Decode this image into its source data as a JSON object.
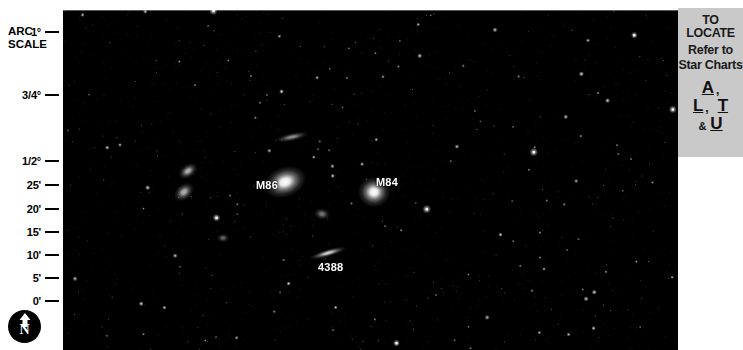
{
  "arc_scale": {
    "title_line1": "ARC",
    "title_line2": "SCALE",
    "ticks": [
      {
        "label": "1°",
        "y": 32
      },
      {
        "label": "3/4°",
        "y": 95
      },
      {
        "label": "1/2°",
        "y": 161
      },
      {
        "label": "25'",
        "y": 185
      },
      {
        "label": "20'",
        "y": 209
      },
      {
        "label": "15'",
        "y": 232
      },
      {
        "label": "10'",
        "y": 255
      },
      {
        "label": "5'",
        "y": 278
      },
      {
        "label": "0'",
        "y": 301
      }
    ],
    "compass_label": "N",
    "compass_direction": "north-up"
  },
  "sky_photo": {
    "background_color": "#000000",
    "labels": [
      {
        "text": "M86",
        "x": 193,
        "y": 170
      },
      {
        "text": "M84",
        "x": 313,
        "y": 167
      },
      {
        "text": "4388",
        "x": 255,
        "y": 252
      }
    ],
    "galaxies": [
      {
        "name": "M86",
        "x": 222,
        "y": 172,
        "rx": 11.5,
        "ry": 8.0,
        "angle": -20,
        "brightness": 1.0
      },
      {
        "name": "M84",
        "x": 311,
        "y": 182,
        "rx": 8.5,
        "ry": 8.0,
        "angle": 0,
        "brightness": 1.0
      },
      {
        "name": "NGC4388",
        "x": 265,
        "y": 243,
        "rx": 10.0,
        "ry": 2.0,
        "angle": -16,
        "brightness": 0.82
      },
      {
        "name": "NGC4402",
        "x": 229,
        "y": 127,
        "rx": 9.0,
        "ry": 2.2,
        "angle": -12,
        "brightness": 0.55
      },
      {
        "name": "NGC4387",
        "x": 125,
        "y": 161,
        "rx": 5.5,
        "ry": 3.5,
        "angle": -35,
        "brightness": 0.7
      },
      {
        "name": "NGC4413",
        "x": 121,
        "y": 182,
        "rx": 6.0,
        "ry": 4.2,
        "angle": -40,
        "brightness": 0.68
      },
      {
        "name": "anon-1",
        "x": 259,
        "y": 204,
        "rx": 4.5,
        "ry": 3.2,
        "angle": 10,
        "brightness": 0.45
      },
      {
        "name": "anon-2",
        "x": 160,
        "y": 228,
        "rx": 3.4,
        "ry": 2.4,
        "angle": 0,
        "brightness": 0.4
      }
    ],
    "star_count": 420
  },
  "locate_panel": {
    "title": "TO LOCATE",
    "subtitle_line1": "Refer to",
    "subtitle_line2": "Star Charts",
    "charts": [
      "A",
      "L",
      "T",
      "U"
    ],
    "comma": ",",
    "ampersand": "&",
    "background_color": "#c9c9c9"
  }
}
